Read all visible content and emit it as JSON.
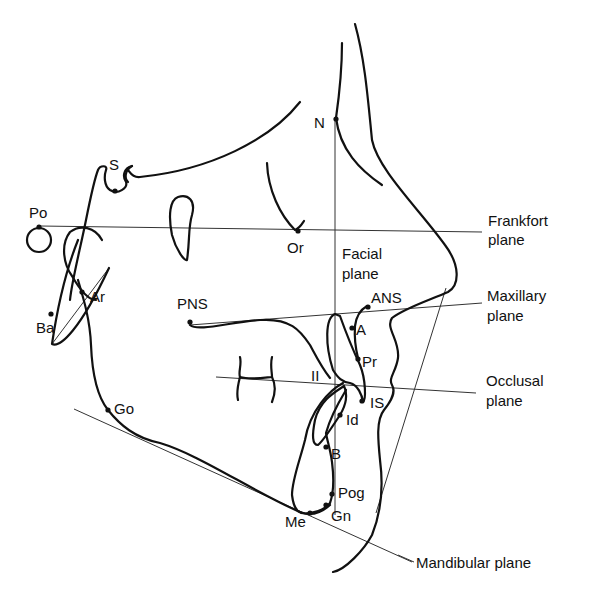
{
  "diagram": {
    "type": "cephalometric-tracing",
    "landmarks": {
      "N": "N",
      "S": "S",
      "Po": "Po",
      "Or": "Or",
      "Ar": "Ar",
      "Ba": "Ba",
      "PNS": "PNS",
      "ANS": "ANS",
      "A": "A",
      "Pr": "Pr",
      "II": "II",
      "IS": "IS",
      "Id": "Id",
      "B": "B",
      "Go": "Go",
      "Pog": "Pog",
      "Gn": "Gn",
      "Me": "Me"
    },
    "planes": {
      "frankfort_line1": "Frankfort",
      "frankfort_line2": "plane",
      "facial_line1": "Facial",
      "facial_line2": "plane",
      "maxillary_line1": "Maxillary",
      "maxillary_line2": "plane",
      "occlusal_line1": "Occlusal",
      "occlusal_line2": "plane",
      "mandibular": "Mandibular plane"
    },
    "colors": {
      "ink": "#111111",
      "background": "#ffffff"
    }
  }
}
